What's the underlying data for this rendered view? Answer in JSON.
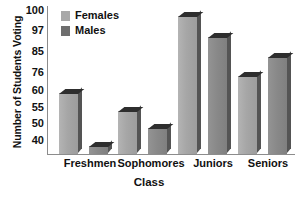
{
  "chart_data": {
    "type": "bar",
    "title": "",
    "xlabel": "Class",
    "ylabel": "Number of Students Voting",
    "categories": [
      "Freshmen",
      "Sophomores",
      "Juniors",
      "Seniors"
    ],
    "series": [
      {
        "name": "Females",
        "color": "#a8a8a8",
        "values": [
          60,
          55,
          100,
          76
        ]
      },
      {
        "name": "Males",
        "color": "#6e6e6e",
        "values": [
          40,
          50,
          97,
          85
        ]
      }
    ],
    "ytick_labels": [
      "100",
      "97",
      "85",
      "76",
      "60",
      "55",
      "50",
      "40"
    ],
    "ytick_values": [
      100,
      97,
      85,
      76,
      60,
      55,
      50,
      40
    ],
    "ytick_positions_px": [
      10,
      30,
      51,
      72,
      90,
      107,
      123,
      140
    ],
    "ylim": [
      40,
      100
    ],
    "grid": false,
    "legend_position": "top-left"
  },
  "axes": {
    "y_title": "Number of Students Voting",
    "x_title": "Class"
  },
  "legend": {
    "items": [
      {
        "label": "Females",
        "color": "#a8a8a8"
      },
      {
        "label": "Males",
        "color": "#6e6e6e"
      }
    ]
  },
  "ticks": {
    "y": [
      {
        "label": "100",
        "top": 10
      },
      {
        "label": "97",
        "top": 30
      },
      {
        "label": "85",
        "top": 51
      },
      {
        "label": "76",
        "top": 72
      },
      {
        "label": "60",
        "top": 90
      },
      {
        "label": "55",
        "top": 107
      },
      {
        "label": "50",
        "top": 123
      },
      {
        "label": "40",
        "top": 140
      }
    ]
  },
  "bars": [
    {
      "name": "freshmen-females",
      "series": "Females",
      "category": "Freshmen",
      "value": 60,
      "left": 12,
      "width": 19,
      "top": 88
    },
    {
      "name": "freshmen-males",
      "series": "Males",
      "category": "Freshmen",
      "value": 40,
      "left": 42,
      "width": 19,
      "top": 141
    },
    {
      "name": "sophomores-females",
      "series": "Females",
      "category": "Sophomores",
      "value": 55,
      "left": 71,
      "width": 19,
      "top": 106
    },
    {
      "name": "sophomores-males",
      "series": "Males",
      "category": "Sophomores",
      "value": 50,
      "left": 101,
      "width": 19,
      "top": 123
    },
    {
      "name": "juniors-females",
      "series": "Females",
      "category": "Juniors",
      "value": 100,
      "left": 131,
      "width": 19,
      "top": 11
    },
    {
      "name": "juniors-males",
      "series": "Males",
      "category": "Juniors",
      "value": 97,
      "left": 161,
      "width": 19,
      "top": 32
    },
    {
      "name": "seniors-females",
      "series": "Females",
      "category": "Seniors",
      "value": 76,
      "left": 191,
      "width": 19,
      "top": 71
    },
    {
      "name": "seniors-males",
      "series": "Males",
      "category": "Seniors",
      "value": 85,
      "left": 221,
      "width": 19,
      "top": 52
    }
  ],
  "xlabels": [
    {
      "label": "Freshmen",
      "center": 90
    },
    {
      "label": "Sophomores",
      "center": 151
    },
    {
      "label": "Juniors",
      "center": 213
    },
    {
      "label": "Seniors",
      "center": 268
    }
  ]
}
